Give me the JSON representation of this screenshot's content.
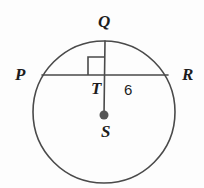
{
  "figure": {
    "kind": "circle-geometry-diagram",
    "background_color": "#fdfdfd",
    "stroke_color": "#4a4a4a",
    "label_color": "#1d1d1d"
  },
  "circle": {
    "name": "circle-S",
    "center_x": 104,
    "center_y": 112,
    "radius": 71,
    "stroke_width": 1.6
  },
  "points": {
    "Q": {
      "label": "Q",
      "x": 105,
      "y": 41
    },
    "P": {
      "label": "P",
      "x": 42,
      "y": 75
    },
    "R": {
      "label": "R",
      "x": 168,
      "y": 75
    },
    "T": {
      "label": "T",
      "x": 105,
      "y": 75
    },
    "S": {
      "label": "S",
      "x": 104,
      "y": 115,
      "is_center": true,
      "dot_radius": 4.5
    }
  },
  "segments": [
    {
      "name": "chord-PR",
      "from": "P",
      "to": "R",
      "x1": 42,
      "y1": 75,
      "x2": 168,
      "y2": 75
    },
    {
      "name": "segment-QS",
      "from": "Q",
      "to": "S",
      "x1": 105,
      "y1": 41,
      "x2": 104,
      "y2": 115
    }
  ],
  "right_angle": {
    "name": "right-angle-marker-QTP",
    "at_point": "T",
    "x": 88,
    "y": 57,
    "size": 17,
    "orientation": "upper-left"
  },
  "measures": [
    {
      "name": "segment-TR-length",
      "value": "6",
      "x": 124,
      "y": 82
    }
  ]
}
